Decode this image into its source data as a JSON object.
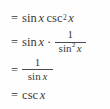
{
  "document": {
    "type": "math-derivation",
    "description": "Trigonometric identity simplification steps",
    "text_color": "#3a3a3c",
    "background_color": "#fefefe",
    "rule_color": "#4a4a4c",
    "plain_text": "= sin x csc^2 x = sin x · 1/(sin^2 x) = 1/(sin x) = csc x"
  },
  "steps": [
    {
      "index": 1,
      "equals": "=",
      "func1": "sin",
      "var1": "x",
      "func2": "csc",
      "exponent2": "2",
      "var2": "x",
      "line_text": "= sin x csc² x"
    },
    {
      "index": 2,
      "equals": "=",
      "func1": "sin",
      "var1": "x",
      "operator": "·",
      "numerator": "1",
      "den_func": "sin",
      "den_exponent": "2",
      "den_var": "x",
      "line_text": "= sin x · 1/sin² x"
    },
    {
      "index": 3,
      "equals": "=",
      "numerator": "1",
      "den_func": "sin",
      "den_var": "x",
      "line_text": "= 1/sin x"
    },
    {
      "index": 4,
      "equals": "=",
      "func1": "csc",
      "var1": "x",
      "line_text": "= csc x"
    }
  ]
}
